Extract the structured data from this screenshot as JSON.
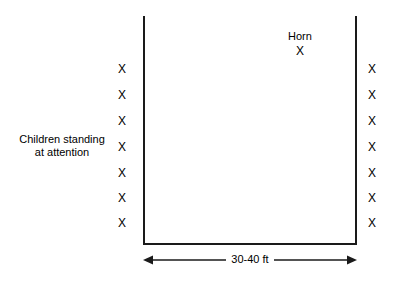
{
  "diagram": {
    "background_color": "#ffffff",
    "line_color": "#1a1a1a",
    "text_color": "#000000",
    "enclosure": {
      "shape": "open-top-rectangle",
      "left_wall_x": 143,
      "right_wall_x": 355,
      "top_y": 16,
      "bottom_y": 243
    },
    "children_label": {
      "line1": "Children standing",
      "line2": "at attention"
    },
    "horn": {
      "label": "Horn",
      "marker": "X"
    },
    "dimension": {
      "label": "30-40 ft",
      "left_arrow": "◀",
      "right_arrow": "▶"
    },
    "marker_symbol": "X",
    "left_column": {
      "count": 7,
      "x": 116,
      "markers": [
        {
          "symbol": "X",
          "y": 63
        },
        {
          "symbol": "X",
          "y": 89
        },
        {
          "symbol": "X",
          "y": 115
        },
        {
          "symbol": "X",
          "y": 141
        },
        {
          "symbol": "X",
          "y": 167
        },
        {
          "symbol": "X",
          "y": 192
        },
        {
          "symbol": "X",
          "y": 217
        }
      ]
    },
    "right_column": {
      "count": 7,
      "x": 366,
      "markers": [
        {
          "symbol": "X",
          "y": 63
        },
        {
          "symbol": "X",
          "y": 89
        },
        {
          "symbol": "X",
          "y": 115
        },
        {
          "symbol": "X",
          "y": 141
        },
        {
          "symbol": "X",
          "y": 167
        },
        {
          "symbol": "X",
          "y": 192
        },
        {
          "symbol": "X",
          "y": 217
        }
      ]
    }
  }
}
